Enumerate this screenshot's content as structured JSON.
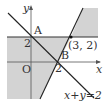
{
  "diagram": {
    "type": "linear-inequality-region",
    "colors": {
      "shade": "#d3d3d3",
      "line": "#222222",
      "axis": "#555555",
      "text": "#333333"
    },
    "axes": {
      "x_label": "x",
      "y_label": "y",
      "origin_label": "O"
    },
    "ticks": {
      "y_tick_label": "2",
      "x_tick_label": "2"
    },
    "points": {
      "A": {
        "label": "A"
      },
      "B": {
        "label": "B"
      },
      "P": {
        "label": "(3, 2)"
      }
    },
    "lines": {
      "sum_line_label": "x+y=2"
    }
  }
}
